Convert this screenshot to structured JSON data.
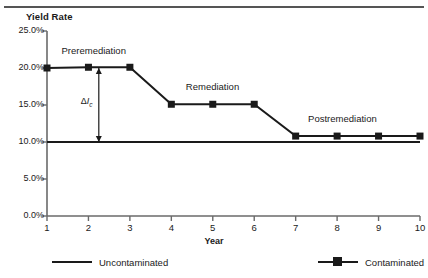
{
  "chart_data": {
    "type": "line",
    "title": "",
    "xlabel": "Year",
    "ylabel": "Yield Rate",
    "x": [
      1,
      2,
      3,
      4,
      5,
      6,
      7,
      8,
      9,
      10
    ],
    "xlim": [
      1,
      10
    ],
    "ylim": [
      0,
      25
    ],
    "ytick_labels": [
      "25.0%",
      "20.0%",
      "15.0%",
      "10.0%",
      "5.0%",
      "0.0%"
    ],
    "ytick_values": [
      25,
      20,
      15,
      10,
      5,
      0
    ],
    "xtick_labels": [
      "1",
      "2",
      "3",
      "4",
      "5",
      "6",
      "7",
      "8",
      "9",
      "10"
    ],
    "grid": false,
    "legend_position": "bottom",
    "series": [
      {
        "name": "Uncontaminated",
        "marker": "none",
        "values": [
          10.0,
          10.0,
          10.0,
          10.0,
          10.0,
          10.0,
          10.0,
          10.0,
          10.0,
          10.0
        ]
      },
      {
        "name": "Contaminated",
        "marker": "square",
        "values": [
          20.0,
          20.1,
          20.1,
          15.1,
          15.1,
          15.1,
          10.8,
          10.8,
          10.8,
          10.8
        ]
      }
    ],
    "annotations": [
      {
        "text": "Preremediation",
        "x": 1.35,
        "y": 22.3
      },
      {
        "text": "Remediation",
        "x": 4.35,
        "y": 17.4
      },
      {
        "text": "Postremediation",
        "x": 7.3,
        "y": 13.1
      },
      {
        "text": "delta-Ic",
        "x": 2.25,
        "y": 15.4
      }
    ],
    "delta_annotation": {
      "symbol": "Δ",
      "variable": "I",
      "subscript": "c",
      "from_y": 20.0,
      "to_y": 10.0,
      "x": 2.25
    }
  },
  "colors": {
    "line": "#1a1a1a",
    "rule": "#555555",
    "axis": "#6a6a6a",
    "text": "#1a1a1a"
  },
  "legend": {
    "uncontaminated_label": "Uncontaminated",
    "contaminated_label": "Contaminated"
  }
}
